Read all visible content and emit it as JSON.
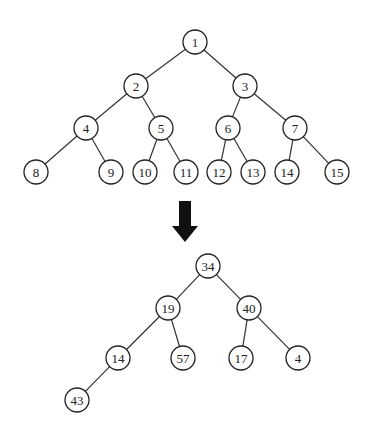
{
  "diagram": {
    "type": "binary-tree-transformation",
    "node_radius": 12,
    "top_tree": {
      "nodes": [
        {
          "id": "t1",
          "label": "1",
          "x": 195,
          "y": 42
        },
        {
          "id": "t2",
          "label": "2",
          "x": 136,
          "y": 86
        },
        {
          "id": "t3",
          "label": "3",
          "x": 245,
          "y": 86
        },
        {
          "id": "t4",
          "label": "4",
          "x": 86,
          "y": 128
        },
        {
          "id": "t5",
          "label": "5",
          "x": 161,
          "y": 128
        },
        {
          "id": "t6",
          "label": "6",
          "x": 228,
          "y": 128
        },
        {
          "id": "t7",
          "label": "7",
          "x": 295,
          "y": 128
        },
        {
          "id": "t8",
          "label": "8",
          "x": 36,
          "y": 172
        },
        {
          "id": "t9",
          "label": "9",
          "x": 111,
          "y": 172
        },
        {
          "id": "t10",
          "label": "10",
          "x": 145,
          "y": 172
        },
        {
          "id": "t11",
          "label": "11",
          "x": 186,
          "y": 172
        },
        {
          "id": "t12",
          "label": "12",
          "x": 219,
          "y": 172
        },
        {
          "id": "t13",
          "label": "13",
          "x": 253,
          "y": 172
        },
        {
          "id": "t14",
          "label": "14",
          "x": 287,
          "y": 172
        },
        {
          "id": "t15",
          "label": "15",
          "x": 337,
          "y": 172
        }
      ],
      "edges": [
        [
          "t1",
          "t2"
        ],
        [
          "t1",
          "t3"
        ],
        [
          "t2",
          "t4"
        ],
        [
          "t2",
          "t5"
        ],
        [
          "t3",
          "t6"
        ],
        [
          "t3",
          "t7"
        ],
        [
          "t4",
          "t8"
        ],
        [
          "t4",
          "t9"
        ],
        [
          "t5",
          "t10"
        ],
        [
          "t5",
          "t11"
        ],
        [
          "t6",
          "t12"
        ],
        [
          "t6",
          "t13"
        ],
        [
          "t7",
          "t14"
        ],
        [
          "t7",
          "t15"
        ]
      ]
    },
    "arrow": {
      "direction": "down",
      "x": 185,
      "y_top": 201,
      "y_bottom": 242,
      "color": "#111111"
    },
    "bottom_tree": {
      "nodes": [
        {
          "id": "b1",
          "label": "34",
          "x": 208,
          "y": 266
        },
        {
          "id": "b2",
          "label": "19",
          "x": 168,
          "y": 308
        },
        {
          "id": "b3",
          "label": "40",
          "x": 249,
          "y": 308
        },
        {
          "id": "b4",
          "label": "14",
          "x": 118,
          "y": 358
        },
        {
          "id": "b5",
          "label": "57",
          "x": 183,
          "y": 358
        },
        {
          "id": "b6",
          "label": "17",
          "x": 241,
          "y": 358
        },
        {
          "id": "b7",
          "label": "4",
          "x": 298,
          "y": 358
        },
        {
          "id": "b8",
          "label": "43",
          "x": 77,
          "y": 400
        }
      ],
      "edges": [
        [
          "b1",
          "b2"
        ],
        [
          "b1",
          "b3"
        ],
        [
          "b2",
          "b4"
        ],
        [
          "b2",
          "b5"
        ],
        [
          "b3",
          "b6"
        ],
        [
          "b3",
          "b7"
        ],
        [
          "b4",
          "b8"
        ]
      ]
    }
  }
}
